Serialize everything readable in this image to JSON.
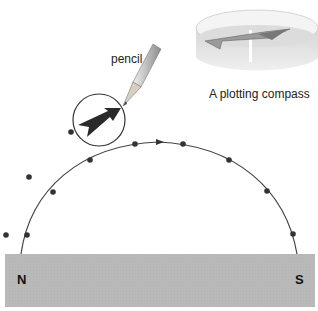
{
  "labels": {
    "pencil": "pencil",
    "compass_caption": "A plotting compass",
    "north_pole": "N",
    "south_pole": "S"
  },
  "magnet": {
    "color": "#b8b8b8",
    "poles": [
      "N",
      "S"
    ]
  },
  "field_line": {
    "color": "#444444",
    "direction": "N to S",
    "plotted_points": 11,
    "stray_points": 2
  },
  "icons": [
    "pencil-icon",
    "compass-needle-icon",
    "plotting-compass-icon",
    "direction-arrow-icon"
  ]
}
